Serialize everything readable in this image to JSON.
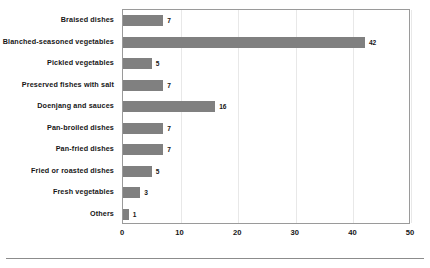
{
  "chart_data": {
    "type": "bar",
    "orientation": "horizontal",
    "title": "",
    "subtitle": "",
    "xlabel": "",
    "ylabel": "",
    "xlim": [
      0,
      50
    ],
    "xticks": [
      0,
      10,
      20,
      30,
      40,
      50
    ],
    "grid": true,
    "grid_axis": "x",
    "legend": false,
    "legend_position": "none",
    "bar_color": "#808080",
    "plot_border_color": "#9a9a9a",
    "background_color": "#ffffff",
    "show_value_labels": true,
    "categories": [
      "Braised dishes",
      "Blanched-seasoned vegetables",
      "Pickled vegetables",
      "Preserved fishes with salt",
      "Doenjang and sauces",
      "Pan-broiled dishes",
      "Pan-fried dishes",
      "Fried or roasted dishes",
      "Fresh vegetables",
      "Others"
    ],
    "values": [
      7,
      42,
      5,
      7,
      16,
      7,
      7,
      5,
      3,
      1
    ],
    "value_labels": [
      "7",
      "42",
      "5",
      "7",
      "16",
      "7",
      "7",
      "5",
      "3",
      "1"
    ],
    "xtick_labels": [
      "0",
      "10",
      "20",
      "30",
      "40",
      "50"
    ]
  }
}
